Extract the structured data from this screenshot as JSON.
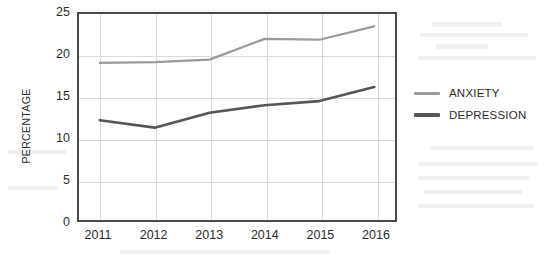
{
  "chart_data": {
    "type": "line",
    "title": "",
    "xlabel": "",
    "ylabel": "PERCENTAGE",
    "categories": [
      "2011",
      "2012",
      "2013",
      "2014",
      "2015",
      "2016"
    ],
    "x": [
      2011,
      2012,
      2013,
      2014,
      2015,
      2016
    ],
    "ylim": [
      0,
      25
    ],
    "yticks": [
      0,
      5,
      10,
      15,
      20,
      25
    ],
    "ytick_labels": [
      "0",
      "5",
      "10",
      "15",
      "20",
      "25"
    ],
    "grid": "horizontal-and-vertical",
    "legend_position": "right",
    "series": [
      {
        "name": "ANXIETY",
        "color": "#9a9a9a",
        "values": [
          19.1,
          19.2,
          19.5,
          22.0,
          21.9,
          23.5
        ]
      },
      {
        "name": "DEPRESSION",
        "color": "#555555",
        "values": [
          12.2,
          11.3,
          13.1,
          14.0,
          14.5,
          16.2
        ]
      }
    ]
  },
  "axes": {
    "y_title": "PERCENTAGE",
    "frame_color": "#4a4a4a",
    "grid_color": "#d9d9d9"
  },
  "legend": {
    "entries": [
      {
        "label": "ANXIETY",
        "color": "#9a9a9a"
      },
      {
        "label": "DEPRESSION",
        "color": "#555555"
      }
    ]
  }
}
